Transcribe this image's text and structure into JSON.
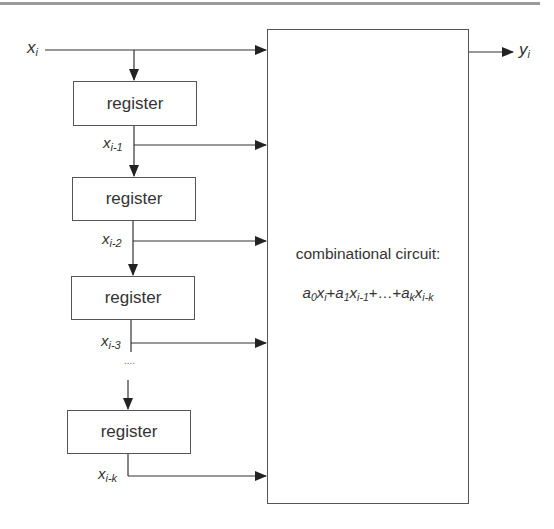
{
  "diagram": {
    "type": "FIR filter / shift-register datapath",
    "input": {
      "var": "x",
      "sub": "i"
    },
    "output": {
      "var": "y",
      "sub": "i"
    },
    "registers": [
      {
        "label": "register",
        "output": {
          "var": "x",
          "sub": "i-1"
        }
      },
      {
        "label": "register",
        "output": {
          "var": "x",
          "sub": "i-2"
        }
      },
      {
        "label": "register",
        "output": {
          "var": "x",
          "sub": "i-3"
        }
      },
      {
        "label": "register",
        "output": {
          "var": "x",
          "sub": "i-k"
        }
      }
    ],
    "ellipsis": "....",
    "combinational": {
      "title": "combinational circuit:",
      "equation": {
        "t0": {
          "a": "a",
          "as": "0",
          "x": "x",
          "xs": "i"
        },
        "t1": {
          "a": "a",
          "as": "1",
          "x": "x",
          "xs": "i-1"
        },
        "plus": "+",
        "dots": "…",
        "tk": {
          "a": "a",
          "as": "k",
          "x": "x",
          "xs": "i-k"
        }
      }
    },
    "colors": {
      "line": "#333333",
      "box_border": "#555555",
      "top_rule": "#9a9a9a",
      "background": "#ffffff"
    }
  }
}
